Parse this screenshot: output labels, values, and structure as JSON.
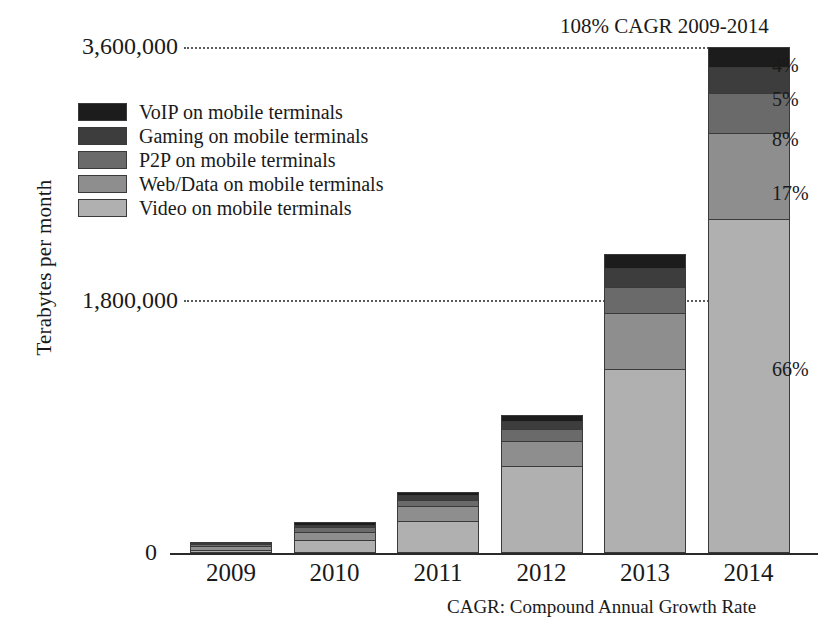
{
  "chart_data": {
    "type": "bar",
    "subtype": "stacked-bar",
    "title": "",
    "xlabel": "",
    "ylabel": "Terabytes per month",
    "categories": [
      "2009",
      "2010",
      "2011",
      "2012",
      "2013",
      "2014"
    ],
    "ylim": [
      0,
      3600000
    ],
    "ytick_labels": [
      "3,600,000",
      "1,800,000",
      "0"
    ],
    "ytick_values": [
      3600000,
      1800000,
      0
    ],
    "grid": "horizontal-dotted",
    "legend_position": "upper-left-inside",
    "stack_order_bottom_to_top": [
      "Video on mobile terminals",
      "Web/Data on mobile terminals",
      "P2P on mobile terminals",
      "Gaming on mobile terminals",
      "VoIP on mobile terminals"
    ],
    "series": [
      {
        "name": "Video on mobile terminals",
        "color": "#b0b0b0",
        "values": [
          20000,
          90000,
          230000,
          620000,
          1310000,
          2376000
        ]
      },
      {
        "name": "Web/Data on mobile terminals",
        "color": "#8e8e8e",
        "values": [
          28000,
          62000,
          105000,
          180000,
          400000,
          612000
        ]
      },
      {
        "name": "P2P on mobile terminals",
        "color": "#6a6a6a",
        "values": [
          14000,
          30000,
          45000,
          85000,
          185000,
          288000
        ]
      },
      {
        "name": "Gaming on mobile terminals",
        "color": "#3d3d3d",
        "values": [
          8000,
          20000,
          32000,
          55000,
          130000,
          180000
        ]
      },
      {
        "name": "VoIP on mobile terminals",
        "color": "#1c1c1c",
        "values": [
          6000,
          16000,
          26000,
          45000,
          105000,
          144000
        ]
      }
    ],
    "totals": [
      76000,
      218000,
      438000,
      985000,
      2130000,
      3600000
    ],
    "annotations": {
      "cagr_note": "108% CAGR 2009-2014",
      "footnote": "CAGR: Compound Annual Growth Rate",
      "percent_callouts": [
        {
          "label": "4%",
          "series": "VoIP on mobile terminals"
        },
        {
          "label": "5%",
          "series": "Gaming on mobile terminals"
        },
        {
          "label": "8%",
          "series": "P2P on mobile terminals"
        },
        {
          "label": "17%",
          "series": "Web/Data on mobile terminals"
        },
        {
          "label": "66%",
          "series": "Video on mobile terminals"
        }
      ]
    }
  },
  "legend": {
    "items": [
      {
        "label": "VoIP on mobile terminals",
        "color": "#1c1c1c"
      },
      {
        "label": "Gaming on mobile terminals",
        "color": "#3d3d3d"
      },
      {
        "label": "P2P on mobile terminals",
        "color": "#6a6a6a"
      },
      {
        "label": "Web/Data on mobile terminals",
        "color": "#8e8e8e"
      },
      {
        "label": "Video on mobile terminals",
        "color": "#b0b0b0"
      }
    ]
  },
  "axis": {
    "y_title": "Terabytes per month",
    "y_tick_top": "3,600,000",
    "y_tick_mid": "1,800,000",
    "y_tick_zero": "0",
    "x_labels": [
      "2009",
      "2010",
      "2011",
      "2012",
      "2013",
      "2014"
    ]
  },
  "notes": {
    "cagr": "108% CAGR 2009-2014",
    "footnote": "CAGR: Compound Annual Growth Rate"
  },
  "callouts": {
    "voip": "4%",
    "gaming": "5%",
    "p2p": "8%",
    "webdata": "17%",
    "video": "66%"
  }
}
